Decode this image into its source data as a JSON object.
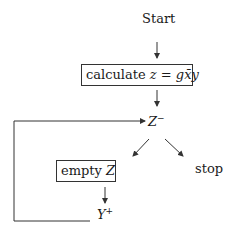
{
  "diagram": {
    "nodes": {
      "start": "Start",
      "calculate_prefix": "calculate ",
      "calculate_formula": "z = gx̄y",
      "z_minus_base": "Z",
      "z_minus_sup": "−",
      "empty_prefix": "empty ",
      "empty_var": "Z",
      "stop": "stop",
      "y_plus_base": "Y",
      "y_plus_sup": "+"
    },
    "edges": [
      {
        "from": "start",
        "to": "calculate"
      },
      {
        "from": "calculate",
        "to": "z_minus"
      },
      {
        "from": "z_minus",
        "to": "empty_z"
      },
      {
        "from": "z_minus",
        "to": "stop"
      },
      {
        "from": "empty_z",
        "to": "y_plus"
      },
      {
        "from": "y_plus",
        "to": "z_minus",
        "style": "loop-back"
      }
    ],
    "colors": {
      "line": "#333333",
      "text": "#1a1a1a",
      "background": "#ffffff"
    }
  }
}
